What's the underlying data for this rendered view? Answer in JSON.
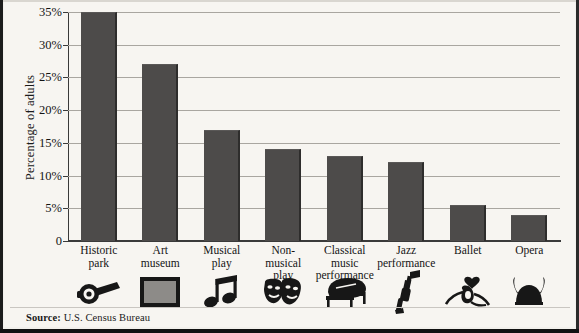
{
  "chart_data": {
    "type": "bar",
    "title": "",
    "subtitle": "",
    "xlabel": "",
    "ylabel": "Percentage of adults",
    "ylim": [
      0,
      35
    ],
    "ytick_values": [
      0,
      5,
      10,
      15,
      20,
      25,
      30,
      35
    ],
    "ytick_labels": [
      "0",
      "5%",
      "10%",
      "15%",
      "20%",
      "25%",
      "30%",
      "35%"
    ],
    "grid": true,
    "legend": "none",
    "categories": [
      "Historic park",
      "Art museum",
      "Musical play",
      "Non-musical play",
      "Classical music performance",
      "Jazz performance",
      "Ballet",
      "Opera"
    ],
    "category_lines": [
      [
        "Historic",
        "park"
      ],
      [
        "Art",
        "museum"
      ],
      [
        "Musical",
        "play"
      ],
      [
        "Non-",
        "musical",
        "play"
      ],
      [
        "Classical",
        "music",
        "performance"
      ],
      [
        "Jazz",
        "performance"
      ],
      [
        "Ballet"
      ],
      [
        "Opera"
      ]
    ],
    "values": [
      35,
      27,
      17,
      14,
      13,
      12,
      5.5,
      4
    ],
    "bar_color": "#4d4b4a",
    "grid_color": "#a9a6a0",
    "axis_color": "#3a3a3a",
    "background_color": "#f7f5f1"
  },
  "icons": [
    {
      "name": "cannon-icon",
      "for": "Historic park"
    },
    {
      "name": "framed-picture-icon",
      "for": "Art museum"
    },
    {
      "name": "music-notes-icon",
      "for": "Musical play"
    },
    {
      "name": "theater-masks-icon",
      "for": "Non-musical play"
    },
    {
      "name": "grand-piano-icon",
      "for": "Classical music performance"
    },
    {
      "name": "trumpet-icon",
      "for": "Jazz performance"
    },
    {
      "name": "ballet-shoes-icon",
      "for": "Ballet"
    },
    {
      "name": "viking-helmet-icon",
      "for": "Opera"
    }
  ],
  "footer": {
    "source_label": "Source:",
    "source_value": "U.S. Census Bureau"
  }
}
